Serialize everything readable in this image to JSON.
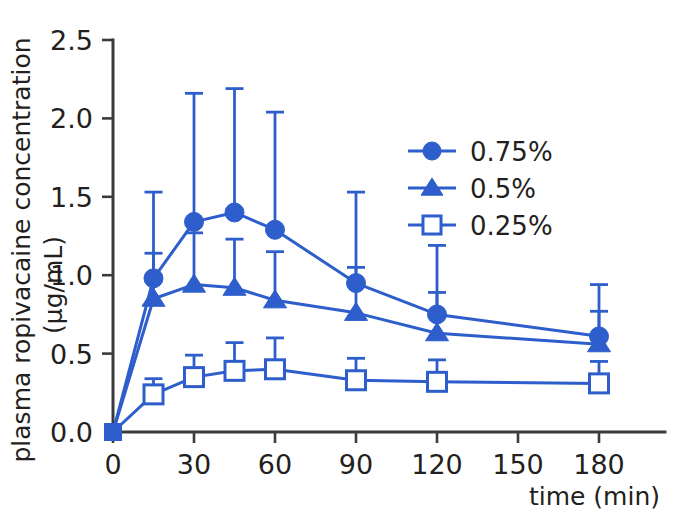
{
  "chart_data": {
    "type": "line",
    "title": "",
    "subtitle": "",
    "xlabel": "time (min)",
    "ylabel": "plasma ropivacaine concentration (μg/mL)",
    "ylabel_line1": "plasma ropivacaine concentration",
    "ylabel_line2": "(μg/mL)",
    "x": [
      0,
      15,
      30,
      45,
      60,
      90,
      120,
      180
    ],
    "xlim": [
      0,
      190
    ],
    "ylim": [
      0.0,
      2.5
    ],
    "xticks": [
      0,
      30,
      60,
      90,
      120,
      150,
      180
    ],
    "xtick_labels": [
      "0",
      "30",
      "60",
      "90",
      "120",
      "150",
      "180"
    ],
    "yticks": [
      0.0,
      0.5,
      1.0,
      1.5,
      2.0,
      2.5
    ],
    "ytick_labels": [
      "0.0",
      "0.5",
      "1.0",
      "1.5",
      "2.0",
      "2.5"
    ],
    "grid": false,
    "legend_position": "upper right",
    "error_bars": "upper-only (SD)",
    "series": [
      {
        "name": "0.75%",
        "marker": "filled-circle",
        "color": "#2d5ecb",
        "values": [
          0.0,
          0.98,
          1.34,
          1.4,
          1.29,
          0.95,
          0.75,
          0.61
        ],
        "err_upper": [
          0.0,
          0.55,
          0.82,
          0.79,
          0.75,
          0.58,
          0.44,
          0.33
        ],
        "err_top": [
          0.0,
          1.53,
          2.16,
          2.19,
          2.04,
          1.53,
          1.19,
          0.94
        ]
      },
      {
        "name": "0.5%",
        "marker": "filled-triangle",
        "color": "#2d5ecb",
        "values": [
          0.0,
          0.85,
          0.94,
          0.92,
          0.84,
          0.76,
          0.63,
          0.56
        ],
        "err_upper": [
          0.0,
          0.29,
          0.33,
          0.31,
          0.31,
          0.29,
          0.26,
          0.21
        ],
        "err_top": [
          0.0,
          1.14,
          1.27,
          1.23,
          1.15,
          1.05,
          0.89,
          0.77
        ]
      },
      {
        "name": "0.25%",
        "marker": "open-square",
        "color": "#2d5ecb",
        "values": [
          0.0,
          0.24,
          0.35,
          0.39,
          0.4,
          0.33,
          0.32,
          0.31
        ],
        "err_upper": [
          0.0,
          0.1,
          0.14,
          0.18,
          0.2,
          0.14,
          0.14,
          0.14
        ],
        "err_top": [
          0.0,
          0.34,
          0.49,
          0.57,
          0.6,
          0.47,
          0.46,
          0.45
        ]
      }
    ]
  },
  "colors": {
    "series_blue": "#2d5ecb",
    "axis_gray": "#3b3b3b",
    "text_black": "#231f20",
    "background": "#ffffff"
  },
  "legend": {
    "items": [
      {
        "label": "0.75%",
        "marker": "filled-circle"
      },
      {
        "label": "0.5%",
        "marker": "filled-triangle"
      },
      {
        "label": "0.25%",
        "marker": "open-square"
      }
    ]
  }
}
